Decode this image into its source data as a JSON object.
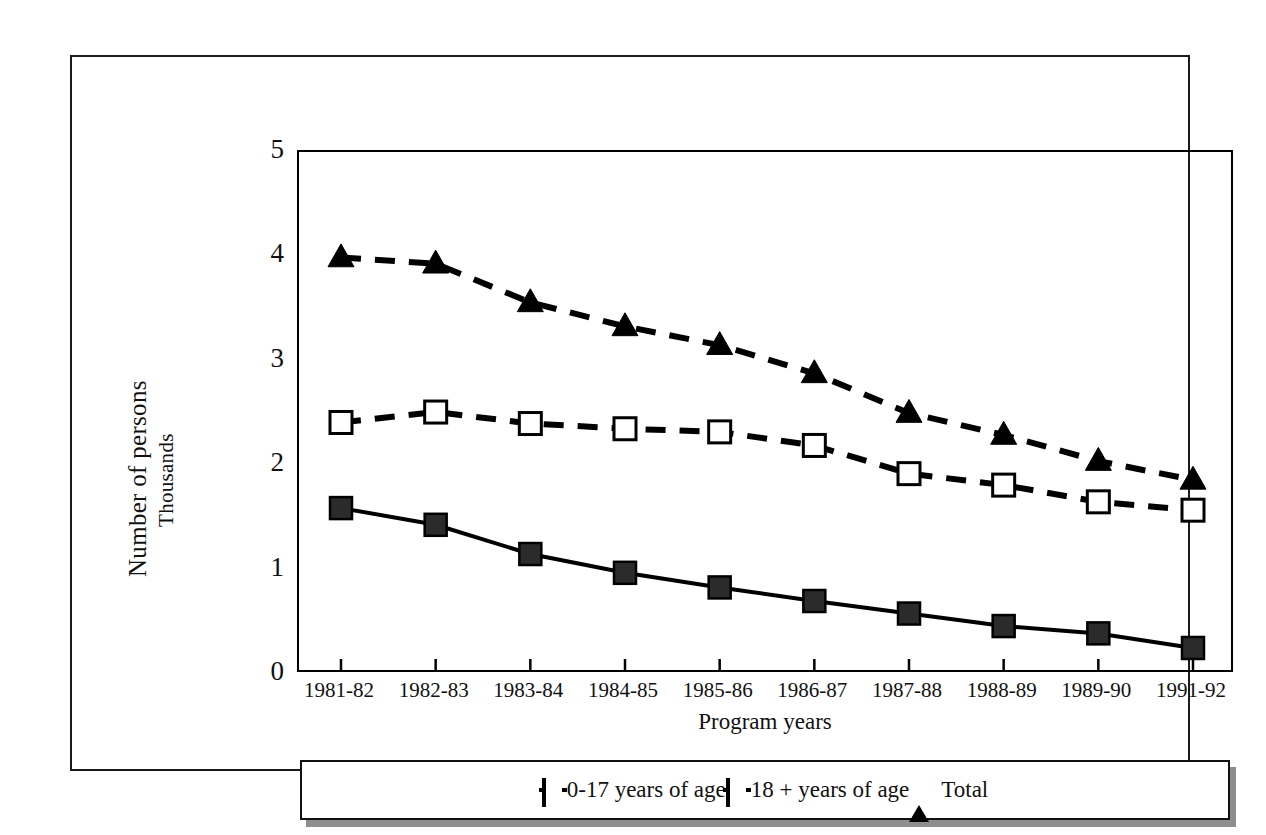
{
  "chart_data": {
    "type": "line",
    "title": "",
    "xlabel": "Program years",
    "ylabel": "Number of persons",
    "ylabel_units": "Thousands",
    "ylim": [
      0,
      5
    ],
    "yticks": [
      5,
      4,
      3,
      2,
      1,
      0
    ],
    "grid": false,
    "legend_position": "bottom",
    "categories": [
      "1981-82",
      "1982-83",
      "1983-84",
      "1984-85",
      "1985-86",
      "1986-87",
      "1987-88",
      "1988-89",
      "1989-90",
      "1991-92"
    ],
    "series": [
      {
        "name": "0-17 years of age",
        "marker": "filled-square",
        "line_style": "solid",
        "values": [
          1.57,
          1.41,
          1.13,
          0.95,
          0.81,
          0.68,
          0.56,
          0.44,
          0.37,
          0.23
        ]
      },
      {
        "name": "18 + years of age",
        "marker": "open-square",
        "line_style": "dashed",
        "values": [
          2.39,
          2.49,
          2.38,
          2.33,
          2.3,
          2.17,
          1.9,
          1.79,
          1.63,
          1.55
        ]
      },
      {
        "name": "Total",
        "marker": "filled-triangle",
        "line_style": "dashed",
        "values": [
          3.97,
          3.91,
          3.54,
          3.31,
          3.13,
          2.86,
          2.48,
          2.27,
          2.02,
          1.84
        ]
      }
    ]
  },
  "colors": {
    "ink": "#000000",
    "text": "#111111",
    "background": "#ffffff",
    "legend_shadow": "#8e8e8e"
  }
}
